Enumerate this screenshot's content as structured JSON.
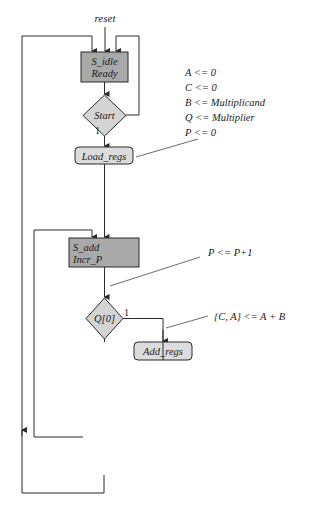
{
  "diagram": {
    "caption": "(a) ASMD chart",
    "reset_label": "reset",
    "states": [
      {
        "name": "S_idle",
        "output": "Ready"
      },
      {
        "name": "S_add",
        "output": "Incr_P"
      },
      {
        "name": "S_shift",
        "output": "Shift_regs"
      }
    ],
    "decisions": [
      {
        "label": "Start",
        "true_label": "1"
      },
      {
        "label": "Q[0]",
        "true_label": "1"
      },
      {
        "label": "Done",
        "true_label": "1"
      }
    ],
    "conditional_outputs": [
      {
        "label": "Load_regs"
      },
      {
        "label": "Add_regs"
      }
    ],
    "annotations": {
      "load_regs": [
        "A <= 0",
        "C <= 0",
        "B <= Multiplicand",
        "Q <= Multiplier",
        "P <= 0"
      ],
      "incr_p": "P <= P+1",
      "add_regs": "{C, A} <= A + B",
      "shift_regs": "{C, A, Q} <= {C, A, Q} >> 1"
    },
    "colors": {
      "state_fill": "#a9a9a9",
      "decision_fill": "#d4d4d4",
      "conditional_fill": "#dcdcdc",
      "line": "#2a2a2a"
    }
  }
}
